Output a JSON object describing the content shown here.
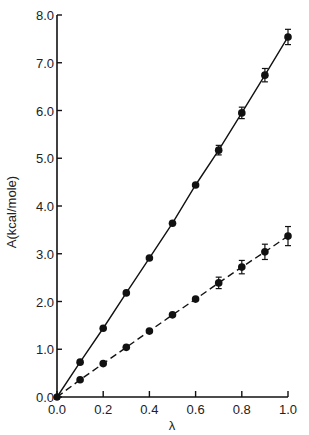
{
  "chart_data": {
    "type": "line",
    "title": "",
    "xlabel": "λ",
    "ylabel": "A(kcal/mole)",
    "xlim": [
      0.0,
      1.0
    ],
    "ylim": [
      0.0,
      8.0
    ],
    "grid": false,
    "legend": null,
    "x_ticks": [
      "0.0",
      "0.2",
      "0.4",
      "0.6",
      "0.8",
      "1.0"
    ],
    "y_ticks": [
      "0.0",
      "1.0",
      "2.0",
      "3.0",
      "4.0",
      "5.0",
      "6.0",
      "7.0",
      "8.0"
    ],
    "x": [
      0.0,
      0.1,
      0.2,
      0.3,
      0.4,
      0.5,
      0.6,
      0.7,
      0.8,
      0.9,
      1.0
    ],
    "series": [
      {
        "name": "solid",
        "line_style": "solid",
        "marker": "filled-circle",
        "values": [
          0.0,
          0.73,
          1.44,
          2.18,
          2.91,
          3.64,
          4.44,
          5.17,
          5.95,
          6.74,
          7.54
        ],
        "error": [
          0,
          0.05,
          0.05,
          0.05,
          0.05,
          0.05,
          0.05,
          0.1,
          0.12,
          0.14,
          0.16
        ]
      },
      {
        "name": "dashed",
        "line_style": "dashed",
        "marker": "filled-circle",
        "values": [
          0.0,
          0.36,
          0.7,
          1.04,
          1.38,
          1.72,
          2.05,
          2.39,
          2.72,
          3.04,
          3.37
        ],
        "error": [
          0,
          0.04,
          0.04,
          0.04,
          0.05,
          0.05,
          0.05,
          0.12,
          0.14,
          0.16,
          0.2
        ]
      }
    ]
  },
  "colors": {
    "ink": "#111111",
    "background": "#ffffff"
  }
}
